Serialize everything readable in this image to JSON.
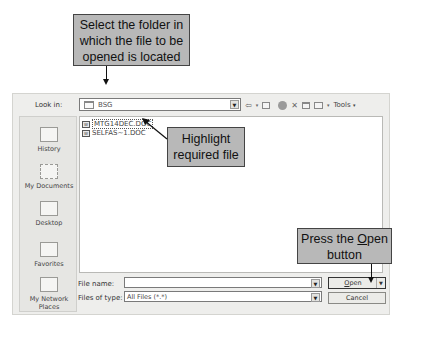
{
  "callouts": {
    "select_folder": [
      "Select the folder in",
      "which the file to be",
      "opened is located"
    ],
    "highlight_file": [
      "Highlight",
      "required file"
    ],
    "press_open": [
      "Press the Open",
      "button"
    ],
    "press_open_mnemonic": "O"
  },
  "dialog": {
    "look_in_label": "Look in:",
    "look_in_value": "BSG",
    "toolbar": {
      "back_icon": "⇦",
      "up_icon": "folder-up",
      "search_web_icon": "search-web",
      "delete_icon": "✕",
      "new_folder_icon": "new-folder",
      "views_icon": "views",
      "tools_label": "Tools",
      "dropdown_glyph": "▾"
    },
    "places": [
      {
        "label": "History",
        "icon": "history-icon"
      },
      {
        "label": "My Documents",
        "icon": "my-documents-icon"
      },
      {
        "label": "Desktop",
        "icon": "desktop-icon"
      },
      {
        "label": "Favorites",
        "icon": "favorites-icon"
      },
      {
        "label": "My Network Places",
        "icon": "network-places-icon"
      }
    ],
    "files": [
      {
        "name": "MTG14DEC.DOC",
        "selected": true
      },
      {
        "name": "SELFAS~1.DOC",
        "selected": false
      }
    ],
    "file_name_label": "File name:",
    "file_name_value": "",
    "files_of_type_label": "Files of type:",
    "files_of_type_value": "All Files (*.*)",
    "open_button": "Open",
    "cancel_button": "Cancel"
  }
}
